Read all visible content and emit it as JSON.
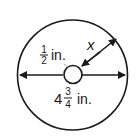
{
  "diagram": {
    "half_label": {
      "num": "1",
      "den": "2",
      "unit": "in."
    },
    "x_label": "x",
    "diameter_label": {
      "whole": "4",
      "num": "3",
      "den": "4",
      "unit": "in."
    },
    "stroke_color": "#1a1a1a",
    "background": "#ffffff"
  }
}
